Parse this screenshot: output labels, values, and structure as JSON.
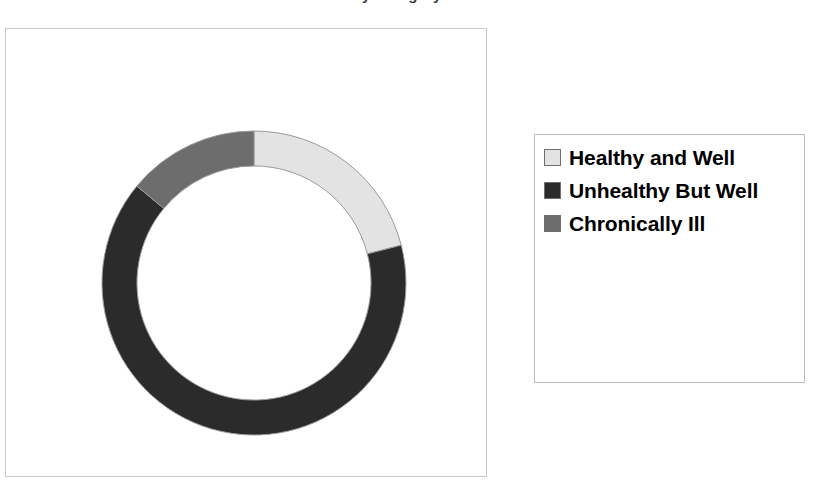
{
  "title": "Distribution of Patients by Category",
  "chart_data": {
    "type": "pie",
    "variant": "donut",
    "title": "Distribution of Patients by Category",
    "categories": [
      "Healthy and Well",
      "Unhealthy But Well",
      "Chronically Ill"
    ],
    "values": [
      21,
      65,
      14
    ],
    "value_unit": "percent",
    "colors": [
      "#e3e3e3",
      "#2b2b2b",
      "#6d6d6d"
    ],
    "start_angle_deg": 0,
    "direction": "clockwise",
    "inner_radius_ratio": 0.77,
    "legend": {
      "position": "right",
      "entries": [
        {
          "label": "Healthy and Well",
          "color": "#e3e3e3"
        },
        {
          "label": "Unhealthy But Well",
          "color": "#2b2b2b"
        },
        {
          "label": "Chronically Ill",
          "color": "#6d6d6d"
        }
      ]
    },
    "grid": false,
    "xlabel": "",
    "ylabel": ""
  },
  "legend": {
    "items": [
      {
        "label": "Healthy and Well",
        "color": "#e3e3e3"
      },
      {
        "label": "Unhealthy But Well",
        "color": "#2b2b2b"
      },
      {
        "label": "Chronically Ill",
        "color": "#6d6d6d"
      }
    ]
  }
}
